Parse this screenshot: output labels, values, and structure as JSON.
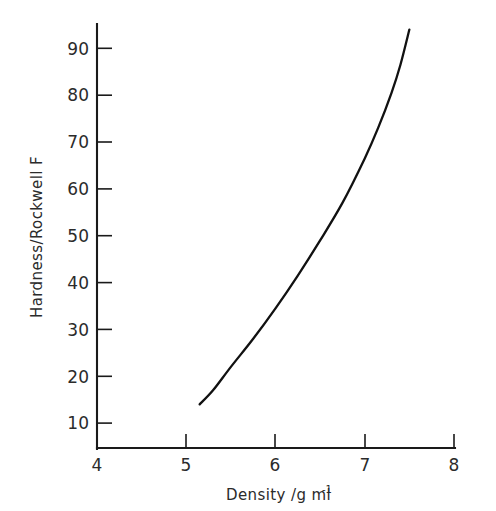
{
  "chart_data": {
    "type": "line",
    "title": "",
    "xlabel": "Density / g ml",
    "xlabel_main": "Density /g ml",
    "xlabel_sup": "-1",
    "ylabel": "Hardness/Rockwell F",
    "xlim": [
      4,
      8
    ],
    "ylim": [
      4,
      96
    ],
    "xticks": [
      4,
      5,
      6,
      7,
      8
    ],
    "xtick_labels": [
      "4",
      "5",
      "6",
      "7",
      "8"
    ],
    "yticks": [
      10,
      20,
      30,
      40,
      50,
      60,
      70,
      80,
      90
    ],
    "ytick_labels": [
      "10",
      "20",
      "30",
      "40",
      "50",
      "60",
      "70",
      "80",
      "90"
    ],
    "grid": false,
    "legend": "none",
    "series": [
      {
        "name": "hardness-vs-density",
        "x": [
          5.15,
          5.3,
          5.5,
          5.75,
          6.0,
          6.25,
          6.5,
          6.75,
          7.0,
          7.15,
          7.3,
          7.4,
          7.5
        ],
        "values": [
          14,
          17,
          22,
          28,
          34.5,
          41.5,
          49,
          57,
          66.5,
          73,
          80.5,
          86.5,
          94
        ]
      }
    ],
    "annotations": []
  },
  "axes": {
    "x_axis_name": "density-axis",
    "y_axis_name": "hardness-axis"
  }
}
